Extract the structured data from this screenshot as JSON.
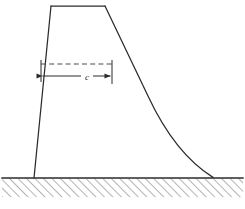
{
  "figure": {
    "background_color": "#ffffff",
    "line_color": "#2b2b2b",
    "hatch_color": "#6e6e6e",
    "dashed_color": "#555555",
    "width_px": 245,
    "height_px": 209
  },
  "labels": {
    "dimension_c": "c"
  },
  "geometry": {
    "crest_left": {
      "x": 51,
      "y": 6
    },
    "crest_right": {
      "x": 105,
      "y": 6
    },
    "heel": {
      "x": 34,
      "y": 178
    },
    "toe": {
      "x": 213,
      "y": 178
    },
    "ground_line_y": 178,
    "ground_left_x": 2,
    "ground_right_x": 243,
    "hatch_band_height": 19,
    "dashed_line_y": 64,
    "dimension_line_y": 76,
    "dimension_left_x": 41,
    "dimension_right_x": 112,
    "downstream_curve": "M105,6 L150,100 Q178,160 213,178"
  },
  "annotations": {
    "upstream_face": "upstream-face-line",
    "crest": "crest-line",
    "downstream_face": "downstream-face-curve",
    "ground": "ground-hatching",
    "dimension": "crest-width-dimension"
  }
}
